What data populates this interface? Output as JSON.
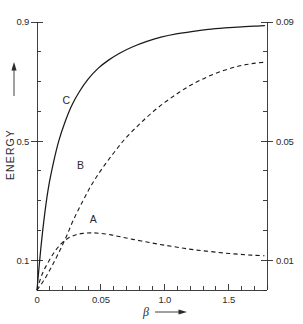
{
  "chart_data": {
    "type": "line",
    "title": "",
    "subtitle": "",
    "xlabel": "β",
    "ylabel": "ENERGY",
    "xlabel_arrow": "⟶",
    "ylabel_arrow": "⟶",
    "grid": false,
    "legend_position": "inline-curve-labels",
    "background_color": "#ffffff",
    "line_color": "#1a1a1a",
    "xlim": [
      0.0,
      1.8
    ],
    "xticks_labeled": [
      {
        "value": 0.0,
        "label": "0"
      },
      {
        "value": 0.5,
        "label": "0.05"
      },
      {
        "value": 1.0,
        "label": "1.0"
      },
      {
        "value": 1.5,
        "label": "1.5"
      }
    ],
    "xticks_minor_step": 0.1,
    "left_axis": {
      "name": "ENERGY",
      "lim": [
        0.0,
        0.9
      ],
      "ticks_labeled": [
        {
          "value": 0.1,
          "label": "0.1"
        },
        {
          "value": 0.5,
          "label": "0.5"
        },
        {
          "value": 0.9,
          "label": "0.9"
        }
      ],
      "ticks_minor_step": 0.1
    },
    "right_axis": {
      "name": "",
      "lim": [
        0.0,
        0.09
      ],
      "ticks_labeled": [
        {
          "value": 0.01,
          "label": "0.01"
        },
        {
          "value": 0.05,
          "label": "0.05"
        },
        {
          "value": 0.09,
          "label": "0.09"
        }
      ],
      "ticks_minor_step": 0.01
    },
    "series": [
      {
        "name": "A",
        "label": "A",
        "style": "dashed",
        "axis": "left",
        "label_x": 0.44,
        "label_y": 0.225,
        "x": [
          0.0,
          0.04,
          0.09,
          0.14,
          0.19,
          0.24,
          0.3,
          0.36,
          0.43,
          0.5,
          0.58,
          0.66,
          0.75,
          0.85,
          0.95,
          1.05,
          1.15,
          1.25,
          1.36,
          1.47,
          1.58,
          1.68,
          1.78
        ],
        "y": [
          0.0,
          0.053,
          0.095,
          0.13,
          0.156,
          0.173,
          0.185,
          0.19,
          0.192,
          0.19,
          0.185,
          0.178,
          0.17,
          0.162,
          0.154,
          0.147,
          0.14,
          0.134,
          0.129,
          0.124,
          0.12,
          0.117,
          0.115
        ]
      },
      {
        "name": "B",
        "label": "B",
        "style": "dashed",
        "axis": "left",
        "label_x": 0.34,
        "label_y": 0.405,
        "x": [
          0.0,
          0.05,
          0.11,
          0.17,
          0.23,
          0.29,
          0.36,
          0.43,
          0.51,
          0.6,
          0.69,
          0.79,
          0.89,
          1.0,
          1.11,
          1.22,
          1.34,
          1.46,
          1.58,
          1.68,
          1.78
        ],
        "y": [
          0.0,
          0.03,
          0.075,
          0.125,
          0.18,
          0.24,
          0.3,
          0.355,
          0.408,
          0.46,
          0.508,
          0.552,
          0.592,
          0.63,
          0.663,
          0.692,
          0.717,
          0.737,
          0.752,
          0.76,
          0.765
        ]
      },
      {
        "name": "C",
        "label": "C",
        "style": "solid",
        "axis": "left",
        "label_x": 0.23,
        "label_y": 0.625,
        "x": [
          0.0,
          0.03,
          0.06,
          0.09,
          0.13,
          0.17,
          0.22,
          0.27,
          0.33,
          0.4,
          0.48,
          0.56,
          0.65,
          0.75,
          0.86,
          0.97,
          1.09,
          1.21,
          1.34,
          1.47,
          1.6,
          1.7,
          1.78
        ],
        "y": [
          0.0,
          0.14,
          0.255,
          0.345,
          0.43,
          0.5,
          0.565,
          0.618,
          0.665,
          0.708,
          0.745,
          0.772,
          0.796,
          0.817,
          0.835,
          0.849,
          0.86,
          0.868,
          0.875,
          0.88,
          0.884,
          0.886,
          0.888
        ]
      }
    ]
  }
}
